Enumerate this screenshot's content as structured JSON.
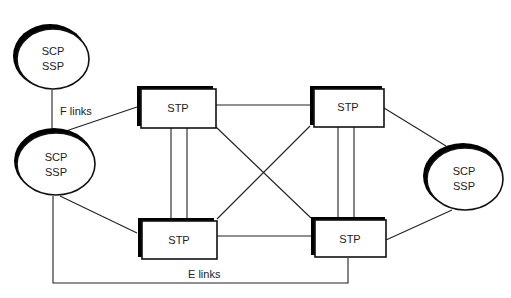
{
  "diagram": {
    "type": "SS7 signaling network topology",
    "nodes": [
      {
        "id": "scp_ssp_top_left",
        "shape": "ellipse",
        "lines": [
          "SCP",
          "SSP"
        ]
      },
      {
        "id": "scp_ssp_left",
        "shape": "ellipse",
        "lines": [
          "SCP",
          "SSP"
        ]
      },
      {
        "id": "scp_ssp_right",
        "shape": "ellipse",
        "lines": [
          "SCP",
          "SSP"
        ]
      },
      {
        "id": "stp_top_left",
        "shape": "box",
        "label": "STP"
      },
      {
        "id": "stp_top_right",
        "shape": "box",
        "label": "STP"
      },
      {
        "id": "stp_bottom_left",
        "shape": "box",
        "label": "STP"
      },
      {
        "id": "stp_bottom_right",
        "shape": "box",
        "label": "STP"
      }
    ],
    "edges": [
      {
        "from": "scp_ssp_top_left",
        "to": "scp_ssp_left",
        "label": "F links"
      },
      {
        "from": "scp_ssp_left",
        "to": "stp_top_left"
      },
      {
        "from": "scp_ssp_left",
        "to": "stp_bottom_left"
      },
      {
        "from": "scp_ssp_left",
        "to": "stp_bottom_right",
        "label": "E links"
      },
      {
        "from": "stp_top_left",
        "to": "stp_top_right"
      },
      {
        "from": "stp_bottom_left",
        "to": "stp_bottom_right"
      },
      {
        "from": "stp_top_left",
        "to": "stp_bottom_left",
        "parallel": 2
      },
      {
        "from": "stp_top_right",
        "to": "stp_bottom_right",
        "parallel": 2
      },
      {
        "from": "stp_top_left",
        "to": "stp_bottom_right"
      },
      {
        "from": "stp_top_right",
        "to": "stp_bottom_left"
      },
      {
        "from": "stp_top_right",
        "to": "scp_ssp_right"
      },
      {
        "from": "stp_bottom_right",
        "to": "scp_ssp_right"
      }
    ],
    "labels": {
      "f_links": "F links",
      "e_links": "E links"
    }
  }
}
